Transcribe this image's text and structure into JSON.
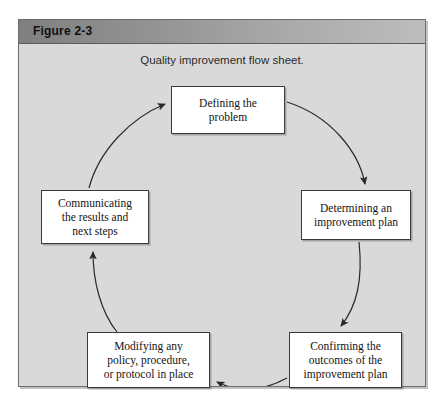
{
  "figure": {
    "label": "Figure 2-3",
    "caption": "Quality improvement flow sheet."
  },
  "diagram": {
    "type": "cycle-flowchart",
    "direction": "clockwise",
    "nodes": [
      {
        "id": "define",
        "label": "Defining the\nproblem"
      },
      {
        "id": "determine",
        "label": "Determining an\nimprovement plan"
      },
      {
        "id": "confirm",
        "label": "Confirming the\noutcomes of the\nimprovement plan"
      },
      {
        "id": "modify",
        "label": "Modifying any\npolicy, procedure,\nor protocol in place"
      },
      {
        "id": "communicate",
        "label": "Communicating\nthe results and\nnext steps"
      }
    ],
    "edges": [
      {
        "from": "define",
        "to": "determine",
        "style": "curved-arrow"
      },
      {
        "from": "determine",
        "to": "confirm",
        "style": "curved-arrow"
      },
      {
        "from": "confirm",
        "to": "modify",
        "style": "curved-arrow"
      },
      {
        "from": "modify",
        "to": "communicate",
        "style": "curved-arrow"
      },
      {
        "from": "communicate",
        "to": "define",
        "style": "curved-arrow"
      }
    ]
  },
  "colors": {
    "header_dark": "#7f7f7f",
    "header_light": "#bdbdbd",
    "panel_background": "#d9d9d9",
    "box_fill": "#ffffff",
    "box_border": "#3a3a3a",
    "arrow": "#2a2a2a",
    "text": "#141414"
  }
}
